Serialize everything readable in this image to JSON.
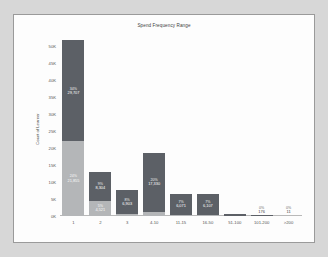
{
  "chart_data": {
    "type": "bar",
    "title": "Spend Frequency Range",
    "xlabel": "",
    "ylabel": "Count of Learner",
    "ylim": [
      0,
      52500
    ],
    "ytick_labels": [
      "50K",
      "45K",
      "40K",
      "35K",
      "30K",
      "25K",
      "20K",
      "15K",
      "10K",
      "5K",
      "0K"
    ],
    "ytick_values": [
      50000,
      45000,
      40000,
      35000,
      30000,
      25000,
      20000,
      15000,
      10000,
      5000,
      0
    ],
    "grid": false,
    "legend": "none",
    "stacked": true,
    "categories": [
      "1",
      "2",
      "3",
      "4-10",
      "11-15",
      "16-50",
      "51-100",
      "101-200",
      ">200"
    ],
    "series": [
      {
        "name": "upper",
        "color": "#5c6066",
        "values": [
          29707,
          8304,
          6903,
          17330,
          6071,
          6107,
          700,
          176,
          11
        ]
      },
      {
        "name": "lower",
        "color": "#b4b6b8",
        "values": [
          21855,
          4521,
          700,
          1200,
          420,
          330,
          0,
          0,
          0
        ]
      }
    ],
    "bars": [
      {
        "category": "1",
        "total": 51562,
        "segments": [
          {
            "series": "upper",
            "pct": "34%",
            "value": "29,707",
            "inside": true
          },
          {
            "series": "lower",
            "pct": "24%",
            "value": "21,855",
            "inside": true
          }
        ]
      },
      {
        "category": "2",
        "total": 12825,
        "segments": [
          {
            "series": "upper",
            "pct": "9%",
            "value": "8,304",
            "inside": true
          },
          {
            "series": "lower",
            "pct": "5%",
            "value": "4,521",
            "inside": true
          }
        ]
      },
      {
        "category": "3",
        "total": 7603,
        "segments": [
          {
            "series": "upper",
            "pct": "8%",
            "value": "6,903",
            "inside": true
          },
          {
            "series": "lower",
            "pct": "",
            "value": "",
            "inside": true
          }
        ]
      },
      {
        "category": "4-10",
        "total": 18530,
        "segments": [
          {
            "series": "upper",
            "pct": "20%",
            "value": "17,330",
            "inside": true
          },
          {
            "series": "lower",
            "pct": "",
            "value": "",
            "inside": true
          }
        ]
      },
      {
        "category": "11-15",
        "total": 6491,
        "segments": [
          {
            "series": "upper",
            "pct": "7%",
            "value": "6,071",
            "inside": true
          },
          {
            "series": "lower",
            "pct": "",
            "value": "",
            "inside": true
          }
        ]
      },
      {
        "category": "16-50",
        "total": 6437,
        "segments": [
          {
            "series": "upper",
            "pct": "7%",
            "value": "6,107",
            "inside": true
          },
          {
            "series": "lower",
            "pct": "",
            "value": "",
            "inside": true
          }
        ]
      },
      {
        "category": "51-100",
        "total": 700,
        "segments": [
          {
            "series": "upper",
            "pct": "",
            "value": "",
            "inside": true
          }
        ]
      },
      {
        "category": "101-200",
        "total": 176,
        "segments": [
          {
            "series": "upper",
            "pct": "0%",
            "value": "176",
            "inside": false
          }
        ]
      },
      {
        "category": ">200",
        "total": 11,
        "segments": [
          {
            "series": "upper",
            "pct": "0%",
            "value": "11",
            "inside": false
          }
        ]
      }
    ]
  }
}
